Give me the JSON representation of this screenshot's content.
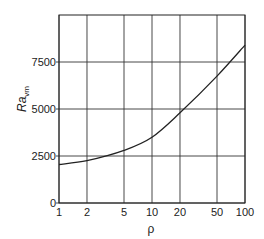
{
  "chart_data": {
    "type": "line",
    "title": "",
    "xlabel": "ρ",
    "ylabel": "Ra_vm",
    "ylabel_main": "Ra",
    "ylabel_sub": "vm",
    "x_scale": "log",
    "xlim": [
      1,
      100
    ],
    "ylim": [
      0,
      10000
    ],
    "x_ticks": [
      1,
      2,
      5,
      10,
      20,
      50,
      100
    ],
    "x_tick_labels": [
      "1",
      "2",
      "5",
      "10",
      "20",
      "50",
      "100"
    ],
    "y_ticks": [
      0,
      2500,
      5000,
      7500
    ],
    "y_tick_labels": [
      "0",
      "2500",
      "5000",
      "7500"
    ],
    "grid": true,
    "legend": null,
    "series": [
      {
        "name": "Ra_vm vs ρ",
        "x": [
          1,
          2,
          5,
          10,
          20,
          50,
          100
        ],
        "values": [
          2050,
          2250,
          2800,
          3500,
          4800,
          6750,
          8400
        ]
      }
    ]
  }
}
